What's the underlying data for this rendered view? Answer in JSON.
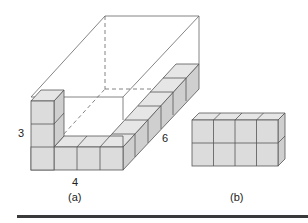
{
  "figure": {
    "part_a": {
      "caption": "(a)",
      "dimension_labels": {
        "height": "3",
        "width": "4",
        "depth": "6"
      },
      "description": "Open rectangular box outline 4 wide × 6 deep × 3 high partly filled with unit cubes along the front row, left column stack and right side row"
    },
    "part_b": {
      "caption": "(b)",
      "description": "Block of unit cubes 4 wide × 2 high"
    }
  },
  "colors": {
    "cube_face": "#dcdcdc",
    "cube_top": "#e6e6e6",
    "cube_side": "#cfcfcf",
    "edge": "#555555",
    "outline": "#666666",
    "rule": "#3a3a3a"
  }
}
